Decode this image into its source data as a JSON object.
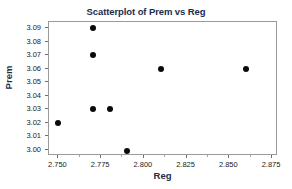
{
  "chart_data": {
    "type": "scatter",
    "title": "Scatterplot of Prem vs Reg",
    "xlabel": "Reg",
    "ylabel": "Prem",
    "xlim": [
      2.7445,
      2.8785
    ],
    "ylim": [
      2.9955,
      3.0945
    ],
    "grid": false,
    "legend": null,
    "marker_color": "#0a0a0a",
    "title_color": "#1c2c4c",
    "xticks": [
      "2.750",
      "2.775",
      "2.800",
      "2.825",
      "2.850",
      "2.875"
    ],
    "xtick_values": [
      2.75,
      2.775,
      2.8,
      2.825,
      2.85,
      2.875
    ],
    "yticks": [
      "3.09",
      "3.08",
      "3.07",
      "3.06",
      "3.05",
      "3.04",
      "3.03",
      "3.02",
      "3.01",
      "3.00"
    ],
    "ytick_values": [
      3.09,
      3.08,
      3.07,
      3.06,
      3.05,
      3.04,
      3.03,
      3.02,
      3.01,
      3.0
    ],
    "x": [
      2.75,
      2.77,
      2.77,
      2.77,
      2.78,
      2.79,
      2.81,
      2.86
    ],
    "y": [
      3.02,
      3.09,
      3.07,
      3.03,
      3.03,
      2.999,
      3.06,
      3.06
    ],
    "points": [
      {
        "x": 2.75,
        "y": 3.02
      },
      {
        "x": 2.77,
        "y": 3.09
      },
      {
        "x": 2.77,
        "y": 3.07
      },
      {
        "x": 2.77,
        "y": 3.03
      },
      {
        "x": 2.78,
        "y": 3.03
      },
      {
        "x": 2.79,
        "y": 2.999
      },
      {
        "x": 2.81,
        "y": 3.06
      },
      {
        "x": 2.86,
        "y": 3.06
      }
    ]
  }
}
